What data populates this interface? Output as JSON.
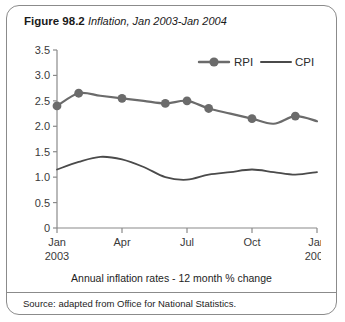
{
  "figure": {
    "label": "Figure 98.2",
    "subtitle": "Inflation, Jan 2003-Jan 2004",
    "caption": "Annual inflation rates - 12 month % change",
    "source": "Source: adapted from Office for National Statistics."
  },
  "colors": {
    "series_rpi": "#6b6b6b",
    "series_cpi": "#4a4a4a",
    "axis": "#8a8a8a",
    "border": "#8b8b8b",
    "text": "#1d1d1d"
  },
  "chart_data": {
    "type": "line",
    "title": "Inflation, Jan 2003-Jan 2004",
    "xlabel": "",
    "ylabel": "",
    "ylim": [
      0,
      3.5
    ],
    "ytick_labels": [
      "0",
      "0.5",
      "1.0",
      "1.5",
      "2.0",
      "2.5",
      "3.0",
      "3.5"
    ],
    "ytick_values": [
      0,
      0.5,
      1.0,
      1.5,
      2.0,
      2.5,
      3.0,
      3.5
    ],
    "xtick_labels": [
      "Jan",
      "Apr",
      "Jul",
      "Oct",
      "Jan"
    ],
    "xtick_sublabels": [
      "2003",
      "",
      "",
      "",
      "2004"
    ],
    "xtick_positions": [
      0,
      3,
      6,
      9,
      12
    ],
    "grid": false,
    "legend_position": "top-right",
    "x": [
      "Jan 2003",
      "Feb 2003",
      "Mar 2003",
      "Apr 2003",
      "May 2003",
      "Jun 2003",
      "Jul 2003",
      "Aug 2003",
      "Sep 2003",
      "Oct 2003",
      "Nov 2003",
      "Dec 2003",
      "Jan 2004"
    ],
    "series": [
      {
        "name": "RPI",
        "marker": "circle",
        "markers_at": [
          0,
          1,
          3,
          5,
          6,
          7,
          9,
          11
        ],
        "values": [
          2.4,
          2.65,
          2.6,
          2.55,
          2.5,
          2.45,
          2.5,
          2.35,
          2.25,
          2.15,
          2.05,
          2.2,
          2.1
        ]
      },
      {
        "name": "CPI",
        "marker": "none",
        "markers_at": [],
        "values": [
          1.15,
          1.3,
          1.4,
          1.35,
          1.2,
          1.0,
          0.95,
          1.05,
          1.1,
          1.15,
          1.1,
          1.05,
          1.1
        ]
      }
    ]
  }
}
